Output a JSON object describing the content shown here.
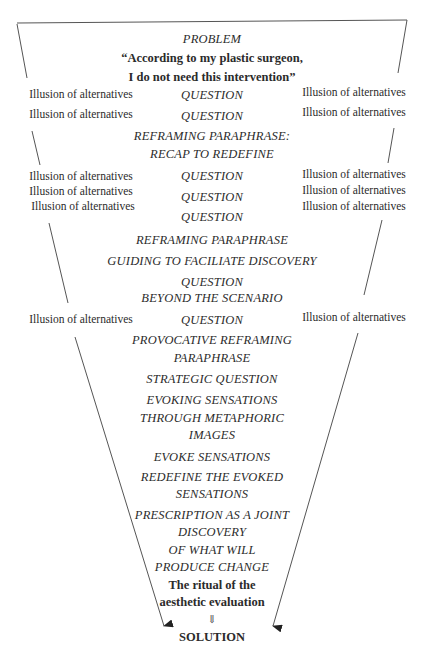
{
  "diagram": {
    "type": "inverted-funnel",
    "problem_label": "PROBLEM",
    "problem_quote_line1": "“According to my plastic surgeon,",
    "problem_quote_line2": "I do not need this intervention”",
    "steps": [
      "QUESTION",
      "QUESTION",
      "REFRAMING PARAPHRASE:",
      "RECAP TO REDEFINE",
      "QUESTION",
      "QUESTION",
      "QUESTION",
      "REFRAMING PARAPHRASE",
      "GUIDING TO FACILIATE DISCOVERY",
      "QUESTION",
      "BEYOND THE SCENARIO",
      "QUESTION",
      "PROVOCATIVE REFRAMING",
      "PARAPHRASE",
      "STRATEGIC QUESTION",
      "EVOKING SENSATIONS",
      "THROUGH METAPHORIC",
      "IMAGES",
      "EVOKE SENSATIONS",
      "REDEFINE THE EVOKED",
      "SENSATIONS",
      "PRESCRIPTION AS A JOINT",
      "DISCOVERY",
      "OF WHAT WILL",
      "PRODUCE CHANGE"
    ],
    "ritual_line1": "The ritual of the",
    "ritual_line2": "aesthetic evaluation",
    "down_arrow_icon": "⇓",
    "solution": "SOLUTION",
    "side_label": "Illusion of alternatives",
    "left_labels": [
      "Illusion of alternatives",
      "Illusion of alternatives",
      "Illusion of alternatives",
      "Illusion of alternatives",
      "Illusion of alternatives",
      "Illusion of alternatives"
    ],
    "right_labels": [
      "Illusion of alternatives",
      "Illusion of alternatives",
      "Illusion of alternatives",
      "Illusion of alternatives",
      "Illusion of alternatives",
      "Illusion of alternatives"
    ],
    "line_color": "#444444",
    "text_color": "#2b2b2b"
  }
}
